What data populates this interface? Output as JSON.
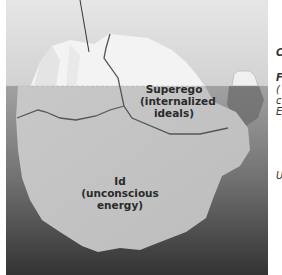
{
  "figure": {
    "labels": {
      "superego": {
        "line1": "Superego",
        "line2": "(internalized",
        "line3": "ideals)"
      },
      "id": {
        "line1": "Id",
        "line2": "(unconscious energy)"
      }
    },
    "cropped_right_edge_glyphs": [
      "C",
      "F",
      "(",
      "c",
      "E",
      "U"
    ],
    "colors": {
      "sky": "#dcdcdc",
      "water_top": "#9a9a9a",
      "water_bottom": "#3a3a3a",
      "ice_above": "#f2f2f2",
      "ice_below": "#c4c4c4",
      "boundary_line": "#555555",
      "margin": "#ffffff"
    }
  }
}
